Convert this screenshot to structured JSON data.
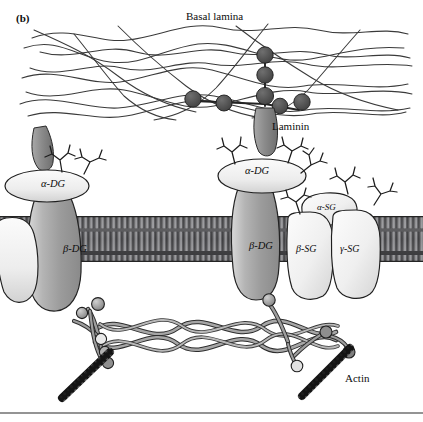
{
  "figure": {
    "panel_label": "(b)",
    "title_caption": "",
    "labels": {
      "basal_lamina": "Basal lamina",
      "laminin": "Laminin",
      "actin": "Actin",
      "alpha_dg_left": "α-DG",
      "beta_dg_left": "β-DG",
      "alpha_dg_right": "α-DG",
      "beta_dg_right": "β-DG",
      "alpha_sg": "α-SG",
      "beta_sg": "β-SG",
      "gamma_sg": "γ-SG"
    },
    "colors": {
      "background": "#ffffff",
      "outline": "#1a1a1a",
      "laminin_node": "#4f4f4f",
      "laminin_stalk": "#8e8e8e",
      "alpha_dg_fill": "#f2f2f2",
      "beta_dg_fill": "#a8a8a8",
      "sarcoglycan_fill": "#ededed",
      "membrane_fill": "#6d6d6d",
      "dystrophin": "#9a9a9a",
      "actin_filament": "#1a1a1a",
      "rule": "#2b2b2b"
    },
    "components": [
      {
        "name": "basal-lamina-network",
        "type": "fiber-mesh",
        "strand_count": 11
      },
      {
        "name": "laminin-molecule",
        "type": "cross-shaped-glycoprotein",
        "node_count": 7
      },
      {
        "name": "alpha-dystroglycan",
        "type": "extracellular-subunit",
        "count": 2
      },
      {
        "name": "beta-dystroglycan",
        "type": "transmembrane-subunit",
        "count": 2
      },
      {
        "name": "sarcoglycan-complex",
        "type": "transmembrane-subunit-group",
        "members": [
          "α-SG",
          "β-SG",
          "γ-SG"
        ]
      },
      {
        "name": "plasma-membrane",
        "type": "lipid-bilayer"
      },
      {
        "name": "dystrophin-rod",
        "type": "coiled-coil-rod"
      },
      {
        "name": "actin-filament",
        "type": "cytoskeletal-filament",
        "count": 2
      },
      {
        "name": "glycan-branches",
        "type": "oligosaccharide",
        "count": 8
      }
    ]
  }
}
